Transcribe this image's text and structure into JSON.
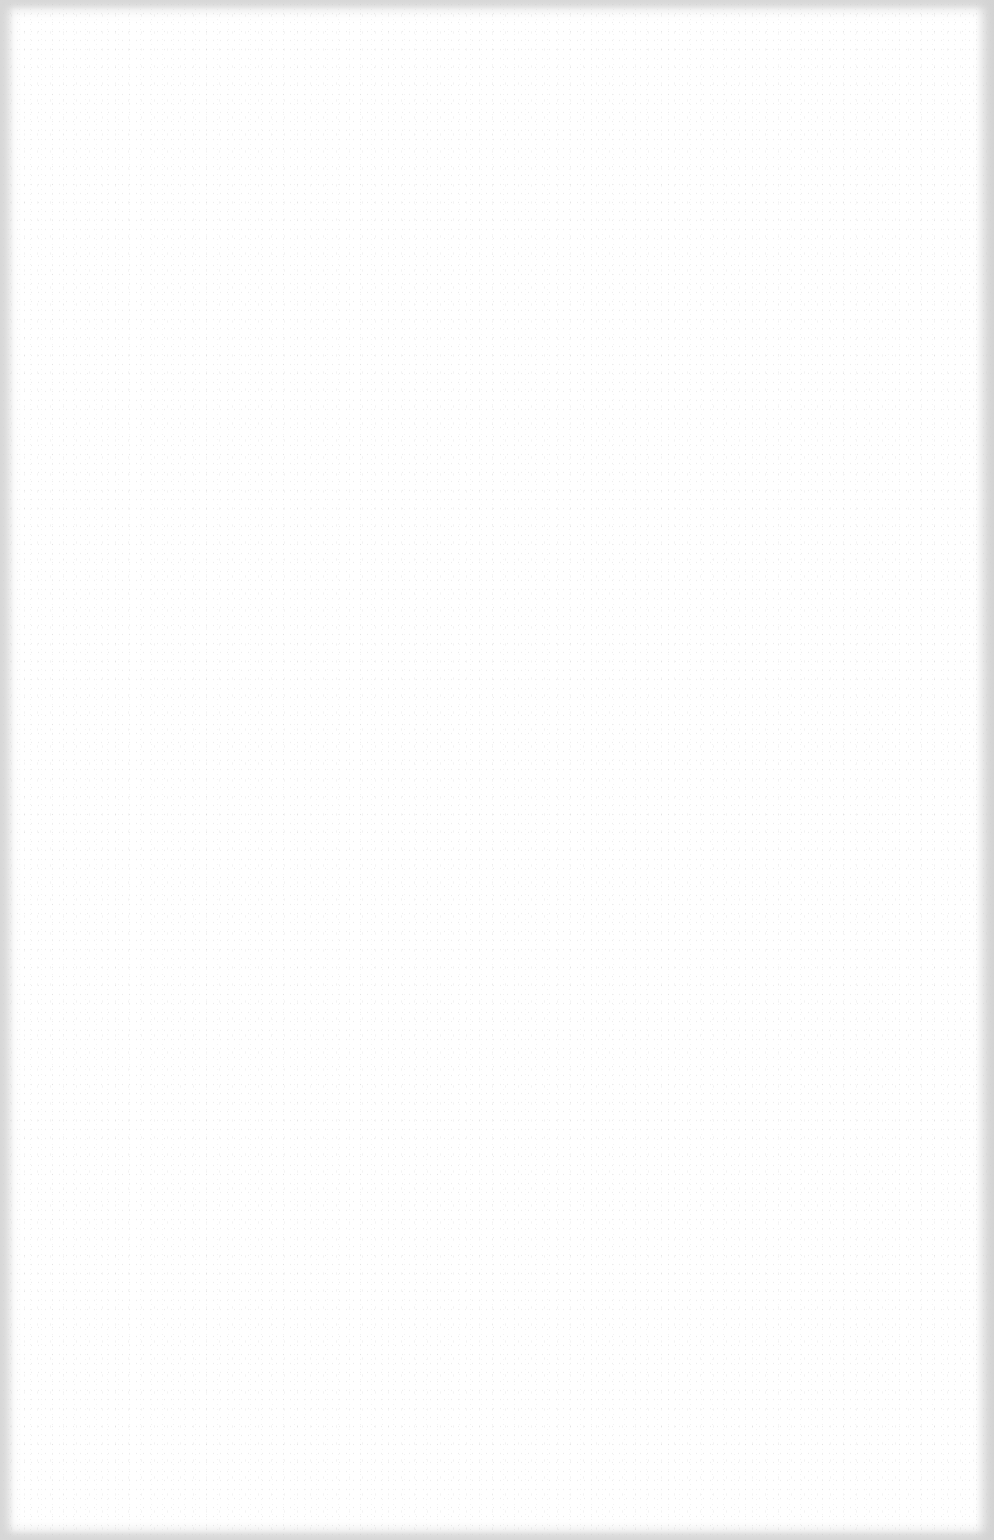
{
  "page": {
    "type": "blank-scanned-page",
    "text": "",
    "background_color": "#ffffff",
    "edge_shade_color": "#e0e0e0"
  }
}
